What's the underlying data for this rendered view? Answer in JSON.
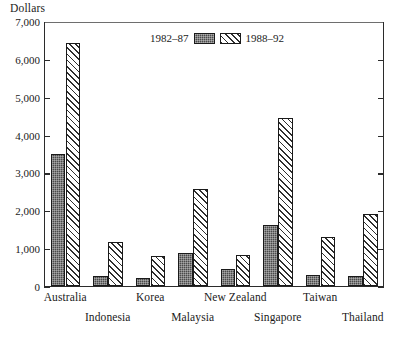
{
  "chart_data": {
    "type": "bar",
    "title": "",
    "ylabel": "Dollars",
    "xlabel": "",
    "ylim": [
      0,
      7000
    ],
    "ytick_values": [
      0,
      1000,
      2000,
      3000,
      4000,
      5000,
      6000,
      7000
    ],
    "ytick_labels": [
      "0",
      "1,000",
      "2,000",
      "3,000",
      "4,000",
      "5,000",
      "6,000",
      "7,000"
    ],
    "grid": false,
    "legend_position": "top-center",
    "categories": [
      "Australia",
      "Indonesia",
      "Korea",
      "Malaysia",
      "New Zealand",
      "Singapore",
      "Taiwan",
      "Thailand"
    ],
    "category_label_rows": [
      "top",
      "bottom",
      "top",
      "bottom",
      "top",
      "bottom",
      "top",
      "bottom"
    ],
    "series": [
      {
        "name": "1982–87",
        "pattern": "dark-stipple",
        "color": "#4a4a4a",
        "values": [
          3500,
          250,
          200,
          880,
          450,
          1600,
          280,
          250
        ]
      },
      {
        "name": "1988–92",
        "pattern": "diagonal-hatch",
        "color": "#ffffff",
        "values": [
          6450,
          1150,
          800,
          2580,
          820,
          4450,
          1280,
          1900
        ]
      }
    ]
  },
  "legend": {
    "left_label": "1982–87",
    "right_label": "1988–92"
  },
  "axis": {
    "y_title": "Dollars"
  }
}
